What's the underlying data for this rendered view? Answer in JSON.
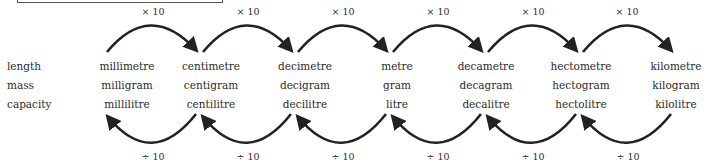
{
  "diagram": {
    "multiply_label": "× 10",
    "divide_label": "÷ 10",
    "rows": [
      {
        "label": "length",
        "units": [
          "millimetre",
          "centimetre",
          "decimetre",
          "metre",
          "decametre",
          "hectometre",
          "kilometre"
        ]
      },
      {
        "label": "mass",
        "units": [
          "milligram",
          "centigram",
          "decigram",
          "gram",
          "decagram",
          "hectogram",
          "kilogram"
        ]
      },
      {
        "label": "capacity",
        "units": [
          "millilitre",
          "centilitre",
          "decilitre",
          "litre",
          "decalitre",
          "hectolitre",
          "kilolitre"
        ]
      }
    ],
    "top_ops": [
      "× 10",
      "× 10",
      "× 10",
      "× 10",
      "× 10",
      "× 10"
    ],
    "bottom_ops": [
      "÷ 10",
      "÷ 10",
      "÷ 10",
      "÷ 10",
      "÷ 10",
      "÷ 10"
    ],
    "arrow_color": "#222222"
  }
}
